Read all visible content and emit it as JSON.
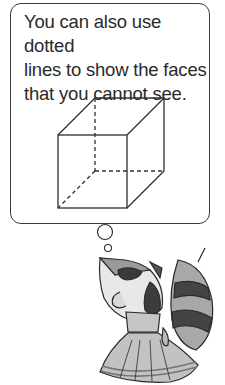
{
  "speech_bubble": {
    "lines": [
      "You can also use dotted",
      "lines to show the faces",
      "that you cannot see."
    ]
  },
  "illustration": {
    "cube": {
      "visible_edges": "solid",
      "hidden_edges": "dashed"
    },
    "character": "raccoon-girl-in-dress-thinking"
  },
  "colors": {
    "line": "#2f2f2f",
    "dress": "#bdbdbd",
    "dark": "#3d3d3d"
  }
}
